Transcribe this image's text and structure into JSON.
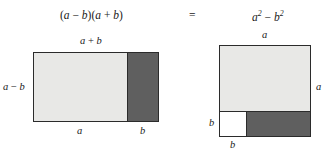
{
  "figure": {
    "equation": {
      "lhs": "(a − b)(a + b)",
      "lhs_parts": {
        "open": "(",
        "a": "a",
        "minus": "−",
        "b": "b",
        "close_open": ")(",
        "a2": "a",
        "plus": "+",
        "b2": "b",
        "close": ")"
      },
      "equals": "=",
      "rhs_a": "a",
      "rhs_a_exp": "2",
      "rhs_minus": "−",
      "rhs_b": "b",
      "rhs_b_exp": "2"
    },
    "colors": {
      "light_fill": "#e8e8e6",
      "dark_fill": "#5f5f5f",
      "white_fill": "#ffffff",
      "stroke": "#2b2b2b",
      "background": "#ffffff",
      "text": "#1a1a1a"
    },
    "left_diagram": {
      "name": "rectangle-a-minus-b-by-a-plus-b",
      "top_label": "a + b",
      "top_label_parts": {
        "a": "a",
        "plus": "+",
        "b": "b"
      },
      "left_label": "a − b",
      "left_label_parts": {
        "a": "a",
        "minus": "−",
        "b": "b"
      },
      "bottom_label_light": "a",
      "bottom_label_dark": "b",
      "regions": [
        {
          "name": "light-region",
          "fill": "#e8e8e6",
          "width_label": "a"
        },
        {
          "name": "dark-region",
          "fill": "#5f5f5f",
          "width_label": "b"
        }
      ]
    },
    "right_diagram": {
      "name": "square-a-by-a",
      "top_label": "a",
      "right_label": "a",
      "left_label_small": "b",
      "bottom_label_small": "b",
      "regions": [
        {
          "name": "light-region",
          "fill": "#e8e8e6"
        },
        {
          "name": "white-square-region",
          "fill": "#ffffff",
          "side_label": "b"
        },
        {
          "name": "dark-region",
          "fill": "#5f5f5f"
        }
      ]
    }
  }
}
